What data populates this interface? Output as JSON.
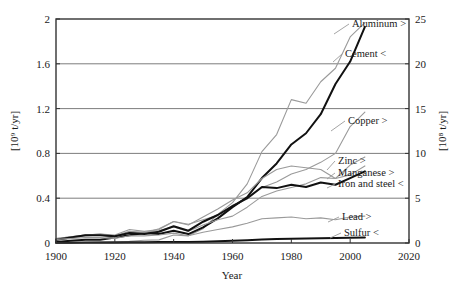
{
  "chart_data": {
    "type": "line",
    "title": "",
    "xlabel": "Year",
    "ylabel_left": "[10⁹ t/yr]",
    "ylabel_right": "[10⁸ t/yr]",
    "xlim": [
      1900,
      2020
    ],
    "xticks": [
      1900,
      1920,
      1940,
      1960,
      1980,
      2000,
      2020
    ],
    "ylim_left": [
      0,
      2
    ],
    "yticks_left": [
      0,
      0.4,
      0.8,
      1.2,
      1.6,
      2
    ],
    "ytick_labels_left": [
      "0",
      "0.4",
      "0.8",
      "1.2",
      "1.6",
      "2"
    ],
    "ylim_right": [
      0,
      25
    ],
    "yticks_right": [
      0,
      5,
      10,
      15,
      20,
      25
    ],
    "ytick_labels_right": [
      "0",
      "5",
      "10",
      "15",
      "20",
      "25"
    ],
    "grid": "horizontal",
    "legend": "inline-end-labels",
    "series": [
      {
        "name": "Aluminum",
        "label": "Aluminum >",
        "axis": "right",
        "color": "#9a9a9a",
        "x": [
          1900,
          1905,
          1910,
          1915,
          1920,
          1925,
          1930,
          1935,
          1940,
          1945,
          1950,
          1955,
          1960,
          1965,
          1970,
          1975,
          1980,
          1985,
          1990,
          1995,
          2000,
          2005
        ],
        "values": [
          0.02,
          0.03,
          0.05,
          0.1,
          0.15,
          0.2,
          0.3,
          0.35,
          0.9,
          0.8,
          1.6,
          3.2,
          4.5,
          6.6,
          10.2,
          12.1,
          16.0,
          15.6,
          18.0,
          19.5,
          23.0,
          24.6
        ]
      },
      {
        "name": "Cement",
        "label": "Cement <",
        "axis": "left",
        "color": "#111111",
        "x": [
          1900,
          1905,
          1910,
          1915,
          1920,
          1925,
          1930,
          1935,
          1940,
          1945,
          1950,
          1955,
          1960,
          1965,
          1970,
          1975,
          1980,
          1985,
          1990,
          1995,
          2000,
          2005
        ],
        "values": [
          0.01,
          0.02,
          0.03,
          0.03,
          0.05,
          0.07,
          0.09,
          0.08,
          0.11,
          0.08,
          0.14,
          0.22,
          0.32,
          0.41,
          0.58,
          0.71,
          0.88,
          0.98,
          1.15,
          1.42,
          1.62,
          1.93
        ]
      },
      {
        "name": "Copper",
        "label": "Copper >",
        "axis": "right",
        "color": "#9a9a9a",
        "x": [
          1900,
          1905,
          1910,
          1915,
          1920,
          1925,
          1930,
          1935,
          1940,
          1945,
          1950,
          1955,
          1960,
          1965,
          1970,
          1975,
          1980,
          1985,
          1990,
          1995,
          2000,
          2005
        ],
        "values": [
          0.5,
          0.7,
          0.9,
          1.0,
          0.9,
          1.5,
          1.3,
          1.5,
          2.4,
          2.1,
          2.6,
          3.1,
          4.2,
          4.9,
          6.2,
          6.8,
          7.7,
          8.2,
          9.0,
          10.0,
          13.0,
          14.6
        ]
      },
      {
        "name": "Zinc",
        "label": "Zinc >",
        "axis": "right",
        "color": "#9a9a9a",
        "x": [
          1900,
          1905,
          1910,
          1915,
          1920,
          1925,
          1930,
          1935,
          1940,
          1945,
          1950,
          1955,
          1960,
          1965,
          1970,
          1975,
          1980,
          1985,
          1990,
          1995,
          2000,
          2005
        ],
        "values": [
          0.5,
          0.7,
          0.9,
          1.0,
          0.8,
          1.3,
          1.2,
          1.4,
          1.8,
          1.3,
          2.0,
          2.6,
          3.0,
          4.0,
          5.2,
          5.8,
          6.2,
          6.6,
          7.3,
          7.2,
          8.7,
          9.6
        ]
      },
      {
        "name": "Manganese",
        "label": "Manganese >",
        "axis": "right",
        "color": "#9a9a9a",
        "x": [
          1900,
          1905,
          1910,
          1915,
          1920,
          1925,
          1930,
          1935,
          1940,
          1945,
          1950,
          1955,
          1960,
          1965,
          1970,
          1975,
          1980,
          1985,
          1990,
          1995,
          2000,
          2005
        ],
        "values": [
          0.3,
          0.5,
          0.8,
          0.9,
          0.6,
          1.2,
          1.1,
          1.6,
          2.4,
          2.0,
          2.9,
          3.8,
          4.8,
          5.6,
          7.2,
          8.2,
          8.6,
          8.4,
          8.2,
          7.2,
          7.6,
          8.6
        ]
      },
      {
        "name": "Iron and steel",
        "label": "Iron and steel <",
        "axis": "left",
        "color": "#111111",
        "x": [
          1900,
          1905,
          1910,
          1915,
          1920,
          1925,
          1930,
          1935,
          1940,
          1945,
          1950,
          1955,
          1960,
          1965,
          1970,
          1975,
          1980,
          1985,
          1990,
          1995,
          2000,
          2005
        ],
        "values": [
          0.03,
          0.05,
          0.07,
          0.07,
          0.06,
          0.09,
          0.08,
          0.1,
          0.15,
          0.11,
          0.19,
          0.25,
          0.33,
          0.4,
          0.5,
          0.49,
          0.52,
          0.5,
          0.54,
          0.52,
          0.58,
          0.64
        ]
      },
      {
        "name": "Lead",
        "label": "Lead >",
        "axis": "right",
        "color": "#9a9a9a",
        "x": [
          1900,
          1905,
          1910,
          1915,
          1920,
          1925,
          1930,
          1935,
          1940,
          1945,
          1950,
          1955,
          1960,
          1965,
          1970,
          1975,
          1980,
          1985,
          1990,
          1995,
          2000,
          2005
        ],
        "values": [
          0.4,
          0.5,
          0.6,
          0.6,
          0.5,
          0.8,
          0.8,
          0.9,
          1.1,
          0.8,
          1.2,
          1.5,
          1.8,
          2.2,
          2.7,
          2.8,
          2.9,
          2.7,
          2.8,
          2.6,
          2.9,
          3.0
        ]
      },
      {
        "name": "Sulfur",
        "label": "Sulfur <",
        "axis": "left",
        "color": "#111111",
        "x": [
          1900,
          1905,
          1910,
          1915,
          1920,
          1925,
          1930,
          1935,
          1940,
          1945,
          1950,
          1955,
          1960,
          1965,
          1970,
          1975,
          1980,
          1985,
          1990,
          1995,
          2000,
          2005
        ],
        "values": [
          0.002,
          0.003,
          0.004,
          0.005,
          0.005,
          0.007,
          0.007,
          0.008,
          0.01,
          0.009,
          0.012,
          0.016,
          0.02,
          0.025,
          0.031,
          0.035,
          0.038,
          0.04,
          0.042,
          0.044,
          0.047,
          0.05
        ]
      }
    ]
  },
  "axes": {
    "left_title": "[10⁹ t/yr]",
    "right_title": "[10⁸ t/yr]",
    "x_title": "Year"
  }
}
